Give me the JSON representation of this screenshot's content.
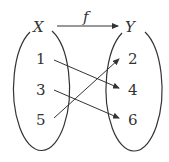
{
  "domain_set": {
    "label": "X",
    "elements": [
      "1",
      "3",
      "5"
    ]
  },
  "codomain_set": {
    "label": "Y",
    "elements": [
      "2",
      "4",
      "6"
    ]
  },
  "function_label": "f",
  "mappings": [
    {
      "from": "1",
      "to": "4"
    },
    {
      "from": "3",
      "to": "6"
    },
    {
      "from": "5",
      "to": "2"
    }
  ],
  "colors": {
    "stroke": "#333333",
    "background": "#ffffff"
  }
}
